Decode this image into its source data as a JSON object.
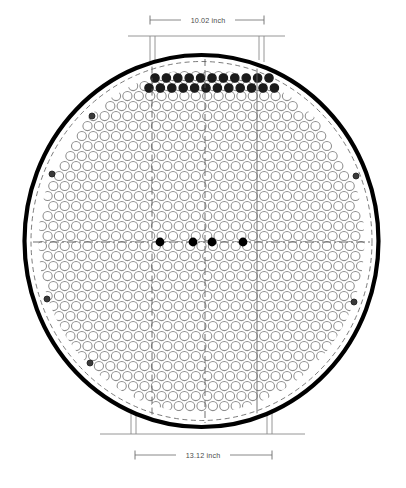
{
  "drawing": {
    "title": "Circular tube sheet cross-section",
    "background_color": "#ffffff",
    "shell_color": "#000000",
    "tube_outline_color": "#8d8d8d",
    "filled_tube_color": "#1b1b1b",
    "centerline_color": "#555555",
    "dimension_line_color": "#6b6b6b",
    "bracket_color": "#8a8a8a"
  },
  "dimensions": {
    "top": {
      "label": "10.02 inch",
      "value": 10.02,
      "units": "inch",
      "position": "top",
      "line_y": 20,
      "x_start": 150,
      "x_end": 264
    },
    "bottom": {
      "label": "13.12 inch",
      "value": 13.12,
      "units": "inch",
      "position": "bottom",
      "line_y": 455,
      "x_start": 135,
      "x_end": 272
    }
  },
  "vessel": {
    "center_x": 201.5,
    "center_y": 241,
    "outer_radius_x": 177,
    "outer_radius_y": 186,
    "shell_thickness": 4.2,
    "inner_dashed_inset": 6.5
  },
  "tube_array": {
    "pattern": "hexagonal",
    "pitch_x": 11.4,
    "pitch_y": 10.0,
    "tube_radius": 4.6,
    "tube_stroke_width": 1.05,
    "array_radius_x": 163,
    "array_radius_y": 172
  },
  "filled_tube_rows": {
    "description": "Two rows of darkened tubes near top of array",
    "rows": [
      {
        "y": 78,
        "x_start": 155,
        "count": 11,
        "spacing": 11.4,
        "radius": 4.2
      },
      {
        "y": 88,
        "x_start": 149,
        "count": 12,
        "spacing": 11.4,
        "radius": 4.2
      }
    ]
  },
  "centerline_markers": {
    "description": "Solid black dots on the horizontal centerline",
    "y": 242,
    "radius": 4.4,
    "x_positions": [
      160,
      193,
      212,
      243
    ]
  },
  "edge_markers": {
    "description": "Small dark reference marks near the shell wall",
    "radius": 3.0,
    "points": [
      {
        "x": 52,
        "y": 174
      },
      {
        "x": 92,
        "y": 116
      },
      {
        "x": 47,
        "y": 299
      },
      {
        "x": 90,
        "y": 363
      },
      {
        "x": 356,
        "y": 176
      },
      {
        "x": 354,
        "y": 302
      }
    ]
  },
  "construction_lines": {
    "vertical_dashed": [
      152,
      205
    ],
    "vertical_solid": [
      257
    ],
    "horizontal_centerline_y": 242
  },
  "brackets": {
    "top": {
      "rail_y": 36,
      "rail_x_start": 128,
      "rail_x_end": 285,
      "legs": [
        {
          "x": 150,
          "y_top": 36,
          "y_bottom": 62
        },
        {
          "x": 155,
          "y_top": 36,
          "y_bottom": 60
        },
        {
          "x": 259,
          "y_top": 36,
          "y_bottom": 60
        },
        {
          "x": 264,
          "y_top": 36,
          "y_bottom": 62
        }
      ]
    },
    "bottom": {
      "rail_y": 434,
      "rail_x_start": 100,
      "rail_x_end": 305,
      "legs": [
        {
          "x": 131,
          "y_top": 409,
          "y_bottom": 434
        },
        {
          "x": 136,
          "y_top": 412,
          "y_bottom": 434
        },
        {
          "x": 267,
          "y_top": 412,
          "y_bottom": 434
        },
        {
          "x": 272,
          "y_top": 409,
          "y_bottom": 434
        }
      ]
    }
  }
}
